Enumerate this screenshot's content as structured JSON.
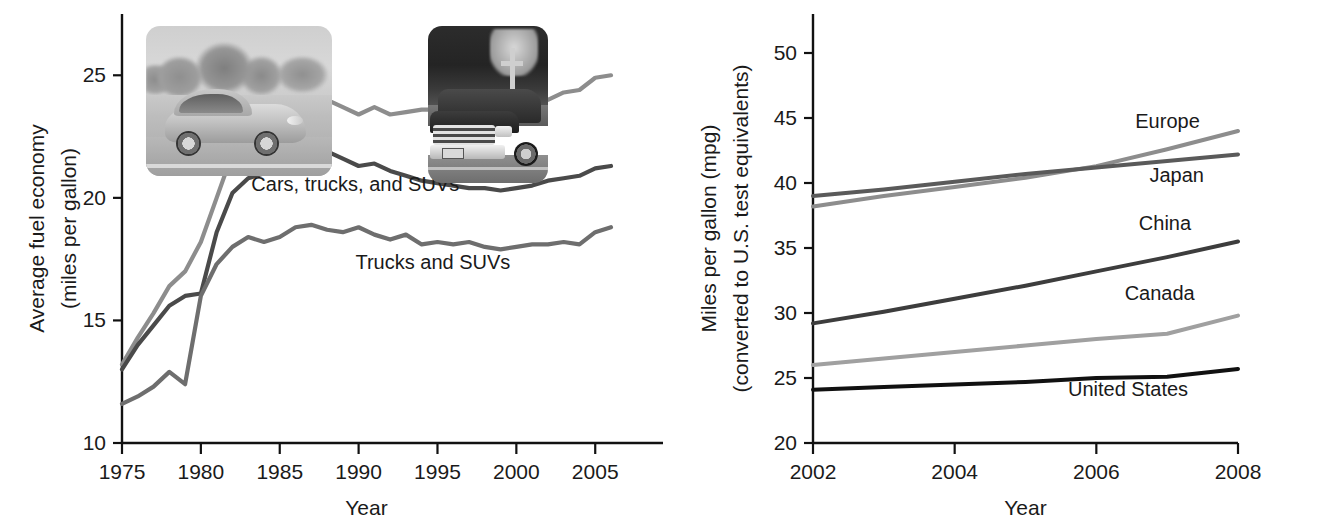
{
  "figure": {
    "panels": [
      {
        "id": "left",
        "ylabel_line1": "Average fuel economy",
        "ylabel_line2": "(miles per gallon)",
        "xlabel": "Year",
        "photos": [
          {
            "name": "compact-car-photo",
            "alt": "Silver compact car driving on a road"
          },
          {
            "name": "pickup-truck-photo",
            "alt": "Black pickup truck on a road"
          }
        ]
      },
      {
        "id": "right",
        "ylabel_line1": "Miles per gallon (mpg)",
        "ylabel_line2": "(converted to U.S. test equivalents)",
        "xlabel": "Year",
        "photos": [
          {
            "name": "smart-car-photo",
            "alt": "Small two-seat city car parked in front of a building"
          }
        ]
      }
    ]
  },
  "chart_data": [
    {
      "type": "line",
      "id": "us-fleet-fuel-economy",
      "title": "",
      "xlabel": "Year",
      "ylabel": "Average fuel economy (miles per gallon)",
      "xlim": [
        1975,
        2006
      ],
      "ylim": [
        10,
        27.5
      ],
      "xticks": [
        1975,
        1980,
        1985,
        1990,
        1995,
        2000,
        2005
      ],
      "yticks": [
        10,
        15,
        20,
        25
      ],
      "grid": false,
      "legend": "inline-labels",
      "x": [
        1975,
        1976,
        1977,
        1978,
        1979,
        1980,
        1981,
        1982,
        1983,
        1984,
        1985,
        1986,
        1987,
        1988,
        1989,
        1990,
        1991,
        1992,
        1993,
        1994,
        1995,
        1996,
        1997,
        1998,
        1999,
        2000,
        2001,
        2002,
        2003,
        2004,
        2005,
        2006
      ],
      "series": [
        {
          "name": "Cars",
          "color": "#8d8d8d",
          "label_x": 1981.2,
          "label_y": 23.4,
          "values": [
            13.2,
            14.3,
            15.3,
            16.4,
            17.0,
            18.2,
            20.0,
            21.8,
            22.3,
            22.6,
            23.2,
            23.6,
            23.8,
            24.0,
            23.7,
            23.4,
            23.7,
            23.4,
            23.5,
            23.6,
            23.6,
            23.4,
            23.4,
            23.4,
            23.3,
            23.6,
            23.8,
            24.0,
            24.3,
            24.4,
            24.9,
            25.0
          ]
        },
        {
          "name": "Cars, trucks, and SUVs",
          "color": "#4a4a4a",
          "label_x": 1983.2,
          "label_y": 20.3,
          "values": [
            13.0,
            14.0,
            14.8,
            15.6,
            16.0,
            16.1,
            18.6,
            20.2,
            20.8,
            21.0,
            21.2,
            21.4,
            21.6,
            21.9,
            21.6,
            21.3,
            21.4,
            21.1,
            20.9,
            20.7,
            20.6,
            20.5,
            20.4,
            20.4,
            20.3,
            20.4,
            20.5,
            20.7,
            20.8,
            20.9,
            21.2,
            21.3
          ]
        },
        {
          "name": "Trucks and SUVs",
          "color": "#6e6e6e",
          "label_x": 1989.8,
          "label_y": 17.1,
          "values": [
            11.6,
            11.9,
            12.3,
            12.9,
            12.4,
            16.0,
            17.3,
            18.0,
            18.4,
            18.2,
            18.4,
            18.8,
            18.9,
            18.7,
            18.6,
            18.8,
            18.5,
            18.3,
            18.5,
            18.1,
            18.2,
            18.1,
            18.2,
            18.0,
            17.9,
            18.0,
            18.1,
            18.1,
            18.2,
            18.1,
            18.6,
            18.8
          ]
        }
      ]
    },
    {
      "type": "line",
      "id": "international-fuel-economy-standards",
      "title": "",
      "xlabel": "Year",
      "ylabel": "Miles per gallon (mpg) (converted to U.S. test equivalents)",
      "xlim": [
        2002,
        2008
      ],
      "ylim": [
        20,
        53
      ],
      "xticks": [
        2002,
        2004,
        2006,
        2008
      ],
      "yticks": [
        20,
        25,
        30,
        35,
        40,
        45,
        50
      ],
      "grid": false,
      "legend": "inline-labels",
      "x": [
        2002,
        2003,
        2004,
        2005,
        2006,
        2007,
        2008
      ],
      "series": [
        {
          "name": "Europe",
          "color": "#8d8d8d",
          "label_x": 2006.55,
          "label_y": 44.2,
          "values": [
            38.2,
            39.0,
            39.7,
            40.4,
            41.3,
            42.6,
            44.0
          ]
        },
        {
          "name": "Japan",
          "color": "#5a5a5a",
          "label_x": 2006.75,
          "label_y": 40.1,
          "values": [
            39.0,
            39.5,
            40.1,
            40.7,
            41.2,
            41.7,
            42.2
          ]
        },
        {
          "name": "China",
          "color": "#3d3d3d",
          "label_x": 2006.6,
          "label_y": 36.4,
          "values": [
            29.2,
            30.1,
            31.1,
            32.1,
            33.2,
            34.3,
            35.5
          ]
        },
        {
          "name": "Canada",
          "color": "#a0a0a0",
          "label_x": 2006.4,
          "label_y": 31.0,
          "values": [
            26.0,
            26.5,
            27.0,
            27.5,
            28.0,
            28.4,
            29.8
          ]
        },
        {
          "name": "United States",
          "color": "#111111",
          "label_x": 2005.6,
          "label_y": 23.6,
          "values": [
            24.1,
            24.3,
            24.5,
            24.7,
            25.0,
            25.1,
            25.7
          ]
        }
      ]
    }
  ]
}
